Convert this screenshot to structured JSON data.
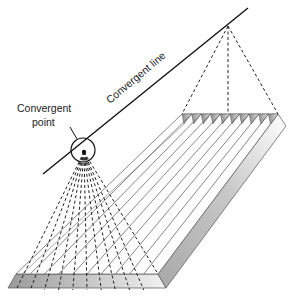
{
  "diagram": {
    "type": "geometric-projection",
    "labels": {
      "convergent_line": "Convergent line",
      "convergent_point_line1": "Convergent",
      "convergent_point_line2": "point"
    },
    "elements": {
      "convergent_line": {
        "from": [
          43,
          174
        ],
        "to": [
          248,
          8
        ]
      },
      "convergent_point": {
        "x": 84,
        "y": 152,
        "circle_radius": 12
      },
      "apex_point": {
        "x": 228,
        "y": 26
      },
      "slab_top_face": {
        "back_left": [
          182,
          114
        ],
        "back_right": [
          278,
          114
        ],
        "front_right": [
          158,
          274
        ],
        "front_left": [
          16,
          274
        ]
      },
      "slab_front_face": {
        "top_y": 274,
        "bottom_y": 288
      },
      "strip_count": 10
    },
    "colors": {
      "line": "#222222",
      "face_dark": "#9a9a9a",
      "face_light": "#ededed"
    }
  }
}
